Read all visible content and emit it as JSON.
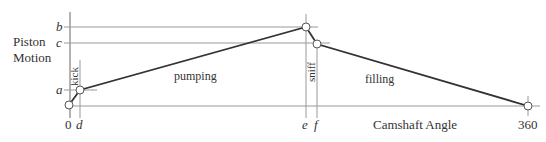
{
  "diagram": {
    "y_axis_label_line1": "Piston",
    "y_axis_label_line2": "Motion",
    "x_axis_label": "Camshaft Angle",
    "y_ticks": {
      "a": "a",
      "b": "b",
      "c": "c"
    },
    "x_ticks": {
      "zero": "0",
      "d": "d",
      "e": "e",
      "f": "f",
      "end": "360"
    },
    "phases": {
      "kick": "kick",
      "pumping": "pumping",
      "sniff": "sniff",
      "filling": "filling"
    },
    "colors": {
      "curve": "#333333",
      "guide": "#999999",
      "text": "#333333"
    }
  }
}
